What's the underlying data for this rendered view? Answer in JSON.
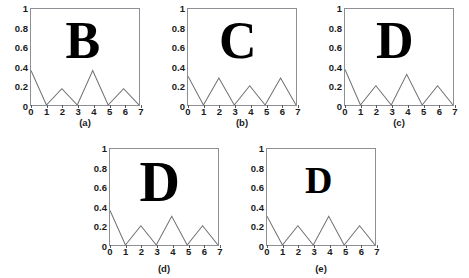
{
  "figure": {
    "background_color": "#ffffff",
    "axis_color": "#8d8f94",
    "line_color": "#6e7075",
    "glyph_color": "#000000",
    "rows": 2,
    "columns_row1": 3,
    "columns_row2": 2
  },
  "axes": {
    "y_ticks": [
      "0",
      "0.2",
      "0.4",
      "0.6",
      "0.8",
      "1"
    ],
    "y_tick_values": [
      0,
      0.2,
      0.4,
      0.6,
      0.8,
      1
    ],
    "x_ticks": [
      "0",
      "1",
      "2",
      "3",
      "4",
      "5",
      "6",
      "7"
    ],
    "x_tick_values": [
      0,
      1,
      2,
      3,
      4,
      5,
      6,
      7
    ],
    "xlim": [
      0,
      7
    ],
    "ylim": [
      0,
      1
    ],
    "grid": false
  },
  "panels": [
    {
      "id": "a",
      "caption": "(a)",
      "letter": "B",
      "letter_size_px": 52,
      "letter_left_pct": 48,
      "letter_top_pct": 6
    },
    {
      "id": "b",
      "caption": "(b)",
      "letter": "C",
      "letter_size_px": 52,
      "letter_left_pct": 46,
      "letter_top_pct": 6
    },
    {
      "id": "c",
      "caption": "(c)",
      "letter": "D",
      "letter_size_px": 52,
      "letter_left_pct": 46,
      "letter_top_pct": 6
    },
    {
      "id": "d",
      "caption": "(d)",
      "letter": "D",
      "letter_size_px": 56,
      "letter_left_pct": 46,
      "letter_top_pct": 5
    },
    {
      "id": "e",
      "caption": "(e)",
      "letter": "D",
      "letter_size_px": 38,
      "letter_left_pct": 48,
      "letter_top_pct": 12
    }
  ],
  "chart_data": [
    {
      "type": "line",
      "id": "a",
      "title": "(a)",
      "xlabel": "",
      "ylabel": "",
      "xlim": [
        0,
        7
      ],
      "ylim": [
        0,
        1
      ],
      "grid": false,
      "legend": "none",
      "annotation_letter": "B",
      "x": [
        0,
        1,
        2,
        3,
        4,
        5,
        6,
        7
      ],
      "values": [
        0.36,
        0.0,
        0.17,
        0.0,
        0.36,
        0.0,
        0.17,
        0.0
      ]
    },
    {
      "type": "line",
      "id": "b",
      "title": "(b)",
      "xlabel": "",
      "ylabel": "",
      "xlim": [
        0,
        7
      ],
      "ylim": [
        0,
        1
      ],
      "grid": false,
      "legend": "none",
      "annotation_letter": "C",
      "x": [
        0,
        1,
        2,
        3,
        4,
        5,
        6,
        7
      ],
      "values": [
        0.3,
        0.0,
        0.28,
        0.0,
        0.2,
        0.0,
        0.28,
        0.0
      ]
    },
    {
      "type": "line",
      "id": "c",
      "title": "(c)",
      "xlabel": "",
      "ylabel": "",
      "xlim": [
        0,
        7
      ],
      "ylim": [
        0,
        1
      ],
      "grid": false,
      "legend": "none",
      "annotation_letter": "D",
      "x": [
        0,
        1,
        2,
        3,
        4,
        5,
        6,
        7
      ],
      "values": [
        0.37,
        0.0,
        0.2,
        0.0,
        0.32,
        0.0,
        0.2,
        0.0
      ]
    },
    {
      "type": "line",
      "id": "d",
      "title": "(d)",
      "xlabel": "",
      "ylabel": "",
      "xlim": [
        0,
        7
      ],
      "ylim": [
        0,
        1
      ],
      "grid": false,
      "legend": "none",
      "annotation_letter": "D",
      "x": [
        0,
        1,
        2,
        3,
        4,
        5,
        6,
        7
      ],
      "values": [
        0.36,
        0.0,
        0.2,
        0.0,
        0.3,
        0.0,
        0.2,
        0.0
      ]
    },
    {
      "type": "line",
      "id": "e",
      "title": "(e)",
      "xlabel": "",
      "ylabel": "",
      "xlim": [
        0,
        7
      ],
      "ylim": [
        0,
        1
      ],
      "grid": false,
      "legend": "none",
      "annotation_letter": "D",
      "x": [
        0,
        1,
        2,
        3,
        4,
        5,
        6,
        7
      ],
      "values": [
        0.3,
        0.0,
        0.2,
        0.0,
        0.3,
        0.0,
        0.2,
        0.0
      ]
    }
  ]
}
